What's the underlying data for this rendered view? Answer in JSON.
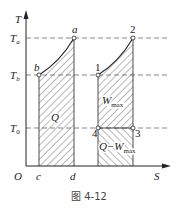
{
  "figure": {
    "caption": "图 4-12",
    "axes": {
      "y_label": "T",
      "x_label": "S",
      "origin": "O"
    },
    "levels": {
      "Ta": {
        "main": "T",
        "sub": "a"
      },
      "Tb": {
        "main": "T",
        "sub": "b"
      },
      "T0": {
        "main": "T",
        "sub": "0"
      }
    },
    "points": {
      "a": "a",
      "b": "b",
      "c": "c",
      "d": "d",
      "p1": "1",
      "p2": "2",
      "p3": "3",
      "p4": "4"
    },
    "regions": {
      "left": "Q",
      "upper_right_main": "W",
      "upper_right_sub": "max",
      "lower_right_main": "Q−W",
      "lower_right_sub": "max"
    },
    "colors": {
      "line": "#222222",
      "dash": "#555555",
      "hatch": "#333333"
    }
  }
}
